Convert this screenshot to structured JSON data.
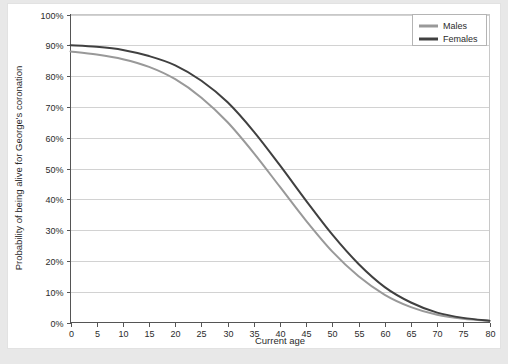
{
  "chart_data": {
    "type": "line",
    "title": "",
    "xlabel": "Current age",
    "ylabel": "Probability of being alive for George's coronation",
    "xlim": [
      0,
      80
    ],
    "ylim": [
      0,
      100
    ],
    "grid": true,
    "legend_position": "top-right",
    "x_ticks": [
      0,
      5,
      10,
      15,
      20,
      25,
      30,
      35,
      40,
      45,
      50,
      55,
      60,
      65,
      70,
      75,
      80
    ],
    "x_tick_labels": [
      "0",
      "5",
      "10",
      "15",
      "20",
      "25",
      "30",
      "35",
      "40",
      "45",
      "50",
      "55",
      "60",
      "65",
      "70",
      "75",
      "80"
    ],
    "y_ticks": [
      0,
      10,
      20,
      30,
      40,
      50,
      60,
      70,
      80,
      90,
      100
    ],
    "y_tick_labels": [
      "0%",
      "10%",
      "20%",
      "30%",
      "40%",
      "50%",
      "60%",
      "70%",
      "80%",
      "90%",
      "100%"
    ],
    "x": [
      0,
      5,
      10,
      15,
      20,
      25,
      30,
      35,
      40,
      45,
      50,
      55,
      60,
      65,
      70,
      75,
      80
    ],
    "series": [
      {
        "name": "Males",
        "color": "#999999",
        "values": [
          88,
          87,
          85.5,
          83,
          79,
          73,
          65,
          55,
          44,
          33,
          23,
          15,
          9,
          5,
          2.5,
          1.2,
          0.5
        ]
      },
      {
        "name": "Females",
        "color": "#404040",
        "values": [
          90,
          89.5,
          88.5,
          86.5,
          83.5,
          78.5,
          71.5,
          62,
          51,
          39.5,
          28.5,
          19,
          11.5,
          6.5,
          3.2,
          1.5,
          0.6
        ]
      }
    ]
  },
  "legend": {
    "items": [
      {
        "label": "Males",
        "color": "#999999"
      },
      {
        "label": "Females",
        "color": "#404040"
      }
    ]
  },
  "colors": {
    "males": "#999999",
    "females": "#404040",
    "grid": "#d2d2d2",
    "axis": "#555555",
    "plot_border": "#c8c8c8",
    "card_background": "#ffffff",
    "page_background": "#e8e8e8"
  }
}
